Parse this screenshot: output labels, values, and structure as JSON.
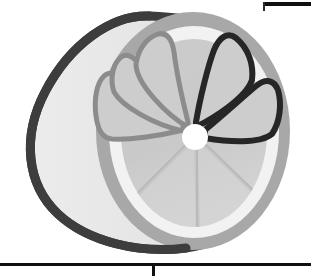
{
  "image": {
    "title": "Halved citrus fruit illustration",
    "subject": "lemon-half-cutaway",
    "style": "grayscale-clipart",
    "width": 311,
    "height": 276,
    "background_color": "#ffffff"
  },
  "palette": {
    "background": "#ffffff",
    "peel_outline": "#3d3d3d",
    "peel_body": "#e8e8e8",
    "peel_body_shade": "#dcdcdc",
    "rim_ring": "#a8a8a8",
    "pith_ring": "#f2f2f2",
    "flesh": "#c9c9c9",
    "flesh_light": "#d6d6d6",
    "segment_outline_gray": "#8c8c8c",
    "segment_outline_dark": "#262626",
    "core_center": "#ffffff",
    "rule_black": "#101010"
  },
  "artwork": {
    "peel": {
      "name": "peel-body",
      "label": "Outer peel of the cut half",
      "outline_color": "#3d3d3d",
      "outline_width": 9,
      "fill": "#e8e8e8"
    },
    "rim": {
      "name": "cut-face-rim",
      "label": "Gray rind ring around cut face",
      "color": "#a8a8a8",
      "thickness": 13,
      "center_x": 193,
      "center_y": 131,
      "radius_x": 97,
      "radius_y": 119
    },
    "pith": {
      "name": "pith-ring",
      "label": "White pith ring inside rind",
      "color": "#f2f2f2",
      "thickness": 14
    },
    "flesh": {
      "name": "flesh-disc",
      "label": "Inner flesh disc",
      "color": "#c9c9c9",
      "center_x": 194,
      "center_y": 133,
      "radius_x": 72,
      "radius_y": 93
    },
    "core": {
      "name": "core-center",
      "label": "White core at center of segments",
      "color": "#ffffff",
      "center_x": 195,
      "center_y": 137,
      "radius": 13
    },
    "segments": [
      {
        "name": "segment-upper-left-outer",
        "outline": "#8c8c8c",
        "outline_width": 5,
        "fill": "#cdcdcd",
        "start_angle": 196,
        "end_angle": 244
      },
      {
        "name": "segment-upper-left-inner",
        "outline": "#8c8c8c",
        "outline_width": 5,
        "fill": "#cdcdcd",
        "start_angle": 244,
        "end_angle": 276
      },
      {
        "name": "segment-top",
        "outline": "#8c8c8c",
        "outline_width": 5,
        "fill": "#cdcdcd",
        "start_angle": 276,
        "end_angle": 308
      },
      {
        "name": "segment-upper-right",
        "outline": "#262626",
        "outline_width": 6,
        "fill": "#cdcdcd",
        "start_angle": 308,
        "end_angle": 340
      },
      {
        "name": "segment-right",
        "outline": "#262626",
        "outline_width": 6,
        "fill": "#cdcdcd",
        "start_angle": 340,
        "end_angle": 10
      },
      {
        "name": "segment-lower-right",
        "outline": "none",
        "fill": "#d2d2d2",
        "divider": "#b9b9b9"
      },
      {
        "name": "segment-bottom",
        "outline": "none",
        "fill": "#d2d2d2",
        "divider": "#b9b9b9"
      },
      {
        "name": "segment-lower-left",
        "outline": "none",
        "fill": "#d2d2d2",
        "divider": "#b9b9b9"
      }
    ],
    "rays": [
      {
        "name": "ray-upper-left-outer",
        "color": "#8c8c8c"
      },
      {
        "name": "ray-upper-left-inner",
        "color": "#8c8c8c"
      },
      {
        "name": "ray-top",
        "color": "#8c8c8c"
      },
      {
        "name": "ray-upper-right",
        "color": "#262626"
      },
      {
        "name": "ray-right",
        "color": "#262626"
      },
      {
        "name": "ray-lower-right",
        "color": "#b9b9b9"
      },
      {
        "name": "ray-bottom",
        "color": "#b9b9b9"
      },
      {
        "name": "ray-lower-left",
        "color": "#b9b9b9"
      }
    ]
  },
  "page_rules": {
    "top_right_rule": {
      "name": "top-right-rule",
      "label": "Black horizontal rule, upper right",
      "color": "#101010",
      "x": 264,
      "y": 2,
      "width": 47,
      "height": 4
    },
    "top_right_tick": {
      "name": "top-right-tick",
      "label": "Short vertical tick at left end of upper rule",
      "color": "#2a2a2a"
    },
    "bottom_rule": {
      "name": "bottom-rule",
      "label": "Black horizontal rule across bottom",
      "color": "#101010",
      "x": 0,
      "y": 263,
      "width": 311,
      "height": 3
    },
    "bottom_tick": {
      "name": "bottom-tick",
      "label": "Vertical tick descending from bottom rule",
      "color": "#101010",
      "x": 152,
      "y": 264,
      "width": 3,
      "height": 12
    }
  }
}
